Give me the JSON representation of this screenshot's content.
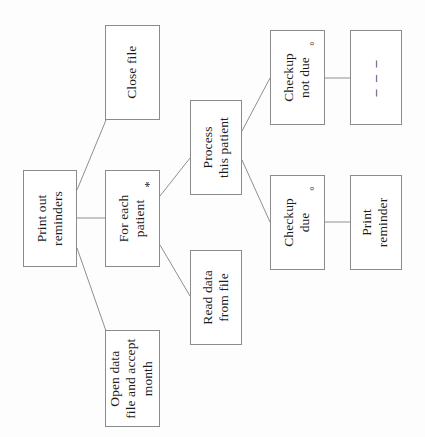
{
  "diagram": {
    "orientation": "rotated-90-ccw",
    "colors": {
      "box_border": "#8b8b8b",
      "box_fill": "#ffffff",
      "connector": "#8f8f8f",
      "text": "#1c1c1c",
      "page_background": "#fdfdfd"
    },
    "nodes": [
      {
        "id": "print-out-reminders",
        "label": "Print out\nreminders",
        "marker": "",
        "marker_type": "none",
        "x": 23,
        "y": 170,
        "w": 54,
        "h": 97
      },
      {
        "id": "close-file",
        "label": "Close file",
        "marker": "",
        "marker_type": "none",
        "x": 105,
        "y": 25,
        "w": 55,
        "h": 95
      },
      {
        "id": "for-each-patient",
        "label": "For each\npatient",
        "marker": "*",
        "marker_type": "iteration",
        "x": 105,
        "y": 170,
        "w": 55,
        "h": 97
      },
      {
        "id": "open-data-file-and-accept-month",
        "label": "Open data\nfile and accept\nmonth",
        "marker": "",
        "marker_type": "none",
        "x": 105,
        "y": 330,
        "w": 55,
        "h": 97
      },
      {
        "id": "process-this-patient",
        "label": "Process\nthis patient",
        "marker": "",
        "marker_type": "none",
        "x": 190,
        "y": 100,
        "w": 52,
        "h": 95
      },
      {
        "id": "read-data-from-file",
        "label": "Read data\nfrom file",
        "marker": "",
        "marker_type": "none",
        "x": 190,
        "y": 250,
        "w": 52,
        "h": 95
      },
      {
        "id": "checkup-not-due",
        "label": "Checkup\nnot due",
        "marker": "°",
        "marker_type": "selection",
        "x": 270,
        "y": 30,
        "w": 55,
        "h": 95
      },
      {
        "id": "checkup-due",
        "label": "Checkup\ndue",
        "marker": "°",
        "marker_type": "selection",
        "x": 270,
        "y": 175,
        "w": 55,
        "h": 95
      },
      {
        "id": "empty-dashes",
        "label": "– – –",
        "marker": "",
        "marker_type": "none",
        "x": 350,
        "y": 30,
        "w": 52,
        "h": 95
      },
      {
        "id": "print-reminder",
        "label": "Print\nreminder",
        "marker": "",
        "marker_type": "none",
        "x": 350,
        "y": 175,
        "w": 52,
        "h": 95
      }
    ],
    "connectors": [
      {
        "id": "root-to-close-file",
        "from": "print-out-reminders",
        "to": "close-file",
        "x1": 77,
        "y1": 190,
        "x2": 106,
        "y2": 120
      },
      {
        "id": "root-to-for-each",
        "from": "print-out-reminders",
        "to": "for-each-patient",
        "x1": 77,
        "y1": 218,
        "x2": 105,
        "y2": 218
      },
      {
        "id": "root-to-open-data",
        "from": "print-out-reminders",
        "to": "open-data-file-and-accept-month",
        "x1": 77,
        "y1": 248,
        "x2": 106,
        "y2": 331
      },
      {
        "id": "foreach-to-process",
        "from": "for-each-patient",
        "to": "process-this-patient",
        "x1": 160,
        "y1": 196,
        "x2": 190,
        "y2": 158
      },
      {
        "id": "foreach-to-read-data",
        "from": "for-each-patient",
        "to": "read-data-from-file",
        "x1": 160,
        "y1": 245,
        "x2": 190,
        "y2": 296
      },
      {
        "id": "process-to-not-due",
        "from": "process-this-patient",
        "to": "checkup-not-due",
        "x1": 242,
        "y1": 131,
        "x2": 270,
        "y2": 78
      },
      {
        "id": "process-to-due",
        "from": "process-this-patient",
        "to": "checkup-due",
        "x1": 242,
        "y1": 160,
        "x2": 270,
        "y2": 222
      },
      {
        "id": "not-due-to-dashes",
        "from": "checkup-not-due",
        "to": "empty-dashes",
        "x1": 325,
        "y1": 78,
        "x2": 350,
        "y2": 78
      },
      {
        "id": "due-to-print-reminder",
        "from": "checkup-due",
        "to": "print-reminder",
        "x1": 325,
        "y1": 222,
        "x2": 350,
        "y2": 222
      }
    ]
  }
}
